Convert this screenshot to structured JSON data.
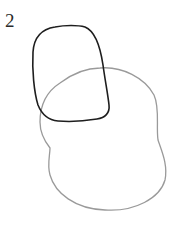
{
  "figure": {
    "label": "2",
    "shapes": [
      {
        "name": "dark-rounded-shape",
        "stroke": "#1e1e1e",
        "description": "rounded square outline"
      },
      {
        "name": "gray-blob-shape",
        "stroke": "#9a9a9a",
        "description": "irregular blob outline"
      }
    ]
  }
}
